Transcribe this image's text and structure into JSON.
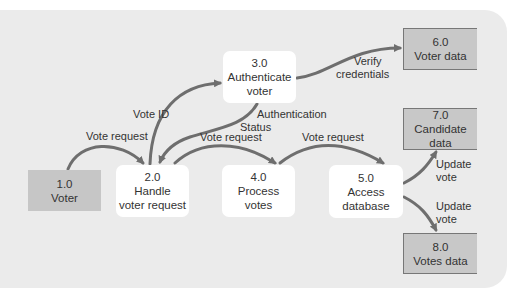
{
  "diagram": {
    "type": "data-flow-diagram",
    "colors": {
      "panel": "#ebebeb",
      "process_fill": "#ffffff",
      "store_fill": "#c8c8c8",
      "entity_fill": "#c6c6c6",
      "arrow": "#6e6e6e",
      "text": "#333333"
    },
    "nodes": {
      "voter": {
        "id": "1.0",
        "name": "Voter",
        "kind": "external-entity"
      },
      "handle": {
        "id": "2.0",
        "name_line1": "Handle",
        "name_line2": "voter request",
        "kind": "process"
      },
      "auth": {
        "id": "3.0",
        "name_line1": "Authenticate",
        "name_line2": "voter",
        "kind": "process"
      },
      "process": {
        "id": "4.0",
        "name_line1": "Process",
        "name_line2": "votes",
        "kind": "process"
      },
      "access": {
        "id": "5.0",
        "name_line1": "Access",
        "name_line2": "database",
        "kind": "process"
      },
      "voter_data": {
        "id": "6.0",
        "name": "Voter data",
        "kind": "data-store"
      },
      "candidate_data": {
        "id": "7.0",
        "name": "Candidate data",
        "kind": "data-store"
      },
      "votes_data": {
        "id": "8.0",
        "name": "Votes data",
        "kind": "data-store"
      }
    },
    "flows": [
      {
        "from": "1.0",
        "to": "2.0",
        "label": "Vote request"
      },
      {
        "from": "2.0",
        "to": "3.0",
        "label": "Vote ID"
      },
      {
        "from": "3.0",
        "to": "2.0",
        "label_line1": "Authentication",
        "label_line2": "Status"
      },
      {
        "from": "3.0",
        "to": "6.0",
        "label_line1": "Verify",
        "label_line2": "credentials"
      },
      {
        "from": "2.0",
        "to": "4.0",
        "label": "Vote request"
      },
      {
        "from": "4.0",
        "to": "5.0",
        "label": "Vote request"
      },
      {
        "from": "5.0",
        "to": "7.0",
        "label_line1": "Update",
        "label_line2": "vote"
      },
      {
        "from": "5.0",
        "to": "8.0",
        "label_line1": "Update",
        "label_line2": "vote"
      }
    ]
  }
}
